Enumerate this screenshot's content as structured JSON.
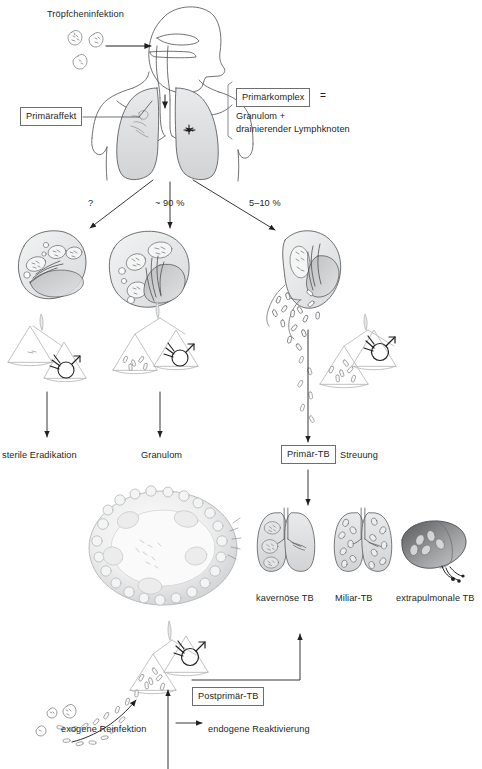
{
  "figure": {
    "language": "de",
    "type": "medical-flow-diagram",
    "ink_color": "#231f20",
    "fill_light": "#eceded",
    "fill_mid": "#d7d8da",
    "fill_dark": "#8d8f91",
    "box_border": "#6d6e71",
    "background": "#ffffff"
  },
  "top": {
    "droplet_label": "Tröpfcheninfektion",
    "primary_affect_box": "Primäraffekt",
    "complex_box": "Primärkomplex",
    "equals_sign": "=",
    "complex_line1": "Granulom +",
    "complex_line2": "drainierender Lymphknoten"
  },
  "branches": [
    {
      "id": "left",
      "probability": "?"
    },
    {
      "id": "middle",
      "probability": "~ 90 %"
    },
    {
      "id": "right",
      "probability": "5–10 %"
    }
  ],
  "outcomes": [
    {
      "id": "eradication",
      "label": "sterile Eradikation",
      "boxed": false
    },
    {
      "id": "granuloma",
      "label": "Granulom",
      "boxed": false
    },
    {
      "id": "primary-tb",
      "label": "Primär-TB",
      "boxed": true
    }
  ],
  "spread": {
    "label": "Streuung",
    "forms": [
      {
        "id": "cavernous",
        "label": "kavernöse TB"
      },
      {
        "id": "miliary",
        "label": "Miliar-TB"
      },
      {
        "id": "extrapulmonal",
        "label": "extrapulmonale TB"
      }
    ]
  },
  "bottom": {
    "postprimary_box": "Postprimär-TB",
    "exogenous_label": "exogene Reinfektion",
    "endogenous_label": "endogene Reaktivierung"
  }
}
